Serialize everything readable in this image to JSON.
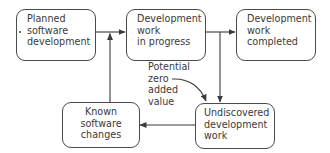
{
  "diagram": {
    "type": "flowchart",
    "colors": {
      "stroke": "#4a4a4a",
      "text": "#3a3a3a",
      "background": "#ffffff"
    },
    "nodes": [
      {
        "id": "planned",
        "lines": [
          "Planned",
          "software",
          "development"
        ]
      },
      {
        "id": "in_progress",
        "lines": [
          "Development",
          "work",
          "in progress"
        ]
      },
      {
        "id": "completed",
        "lines": [
          "Development",
          "work",
          "completed"
        ]
      },
      {
        "id": "known_changes",
        "lines": [
          "Known",
          "software",
          "changes"
        ]
      },
      {
        "id": "undiscovered",
        "lines": [
          "Undiscovered",
          "development",
          "work"
        ]
      }
    ],
    "annotation": {
      "lines": [
        "Potential",
        "zero",
        "added",
        "value"
      ],
      "points_to": "undiscovered"
    },
    "edges": [
      {
        "from": "planned",
        "to": "in_progress"
      },
      {
        "from": "known_changes",
        "to": "in_progress"
      },
      {
        "from": "in_progress",
        "to": "completed"
      },
      {
        "from": "in_progress",
        "to": "undiscovered"
      },
      {
        "from": "undiscovered",
        "to": "known_changes"
      }
    ]
  }
}
